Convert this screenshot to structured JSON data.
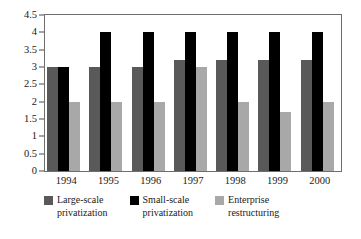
{
  "chart_data": {
    "type": "bar",
    "title": "",
    "xlabel": "",
    "ylabel": "",
    "categories": [
      "1994",
      "1995",
      "1996",
      "1997",
      "1998",
      "1999",
      "2000"
    ],
    "ylim": [
      0,
      4.5
    ],
    "ytick_labels": [
      "0",
      "0.5",
      "1",
      "1.5",
      "2",
      "2.5",
      "3",
      "3.5",
      "4",
      "4.5"
    ],
    "ytick_values": [
      0,
      0.5,
      1,
      1.5,
      2,
      2.5,
      3,
      3.5,
      4,
      4.5
    ],
    "grid": false,
    "legend_position": "bottom",
    "series": [
      {
        "name": "Large-scale\nprivatization",
        "color": "#595959",
        "values": [
          3,
          3,
          3,
          3.2,
          3.2,
          3.2,
          3.2
        ]
      },
      {
        "name": "Small-scale\nprivatization",
        "color": "#000000",
        "values": [
          3,
          4,
          4,
          4,
          4,
          4,
          4
        ]
      },
      {
        "name": "Enterprise\nrestructuring",
        "color": "#a8a8a8",
        "values": [
          2,
          2,
          2,
          3,
          2,
          1.7,
          2
        ]
      }
    ]
  }
}
